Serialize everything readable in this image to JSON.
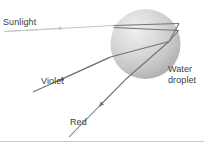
{
  "figure": {
    "background_color": "#ffffff"
  },
  "labels": {
    "sunlight": "Sunlight",
    "violet": "Violet",
    "red": "Red",
    "water_droplet_line1": "Water",
    "water_droplet_line2": "droplet"
  },
  "colors": {
    "text": "#3c3c3c",
    "incoming_ray": "#b9bfc4",
    "internal_ray": "#6f7479",
    "exit_ray": "#6f7479",
    "droplet_light": "#e8e8e8",
    "droplet_mid": "#cfcfcf",
    "droplet_dark": "#9f9f9f",
    "baseline": "#c9c9c9"
  },
  "geometry": {
    "droplet_center_x": 145.5,
    "droplet_center_y": 44,
    "droplet_radius": 35,
    "sunlight_start_x": 4,
    "sunlight_start_y": 31,
    "sunlight_entry_x": 113,
    "sunlight_entry_y": 25,
    "violet_end_x": 33,
    "violet_end_y": 92,
    "red_end_x": 69,
    "red_end_y": 137
  }
}
